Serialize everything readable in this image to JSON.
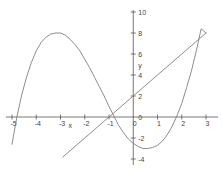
{
  "chart_data": {
    "type": "line",
    "title": "",
    "xlabel": "x",
    "ylabel": "y",
    "xlim": [
      -5,
      3
    ],
    "ylim": [
      -4,
      10
    ],
    "grid": false,
    "legend": "none",
    "xticks": [
      -5,
      -4,
      -3,
      -2,
      -1,
      0,
      1,
      2,
      3
    ],
    "xtick_labels": [
      "-5",
      "-4",
      "-3",
      "-2",
      "-1",
      "0",
      "1",
      "2",
      "3"
    ],
    "yticks": [
      -4,
      -2,
      0,
      2,
      4,
      6,
      8,
      10
    ],
    "ytick_labels": [
      "-4",
      "-2",
      "0",
      "2",
      "4",
      "6",
      "8",
      "10"
    ],
    "series": [
      {
        "name": "cubic-curve",
        "color": "#808080",
        "kind": "curve",
        "x": [
          -5.0,
          -4.8,
          -4.6,
          -4.4,
          -4.2,
          -4.0,
          -3.8,
          -3.6,
          -3.4,
          -3.2,
          -3.0,
          -2.8,
          -2.6,
          -2.4,
          -2.2,
          -2.0,
          -1.8,
          -1.6,
          -1.4,
          -1.2,
          -1.0,
          -0.8,
          -0.6,
          -0.4,
          -0.2,
          0.0,
          0.2,
          0.4,
          0.6,
          0.8,
          1.0,
          1.2,
          1.4,
          1.6,
          1.8,
          2.0,
          2.2,
          2.4,
          2.6,
          2.8,
          3.0
        ],
        "y": [
          -2.6,
          0.0,
          2.1,
          3.8,
          5.2,
          6.3,
          7.1,
          7.6,
          7.9,
          8.0,
          8.0,
          7.8,
          7.4,
          6.9,
          6.3,
          5.5,
          4.7,
          3.8,
          2.9,
          2.0,
          1.0,
          0.1,
          -0.8,
          -1.5,
          -2.1,
          -2.5,
          -2.8,
          -3.0,
          -3.0,
          -2.9,
          -2.7,
          -2.3,
          -1.7,
          -0.9,
          0.1,
          1.3,
          2.8,
          4.4,
          6.3,
          8.4,
          8.0
        ],
        "features": {
          "local_max": {
            "x": -3.0,
            "y": 8.0
          },
          "local_min": {
            "x": 1.0,
            "y": -2.7
          },
          "x_intercepts": [
            -4.8,
            -0.6,
            2.1
          ],
          "y_intercept": -2.5,
          "right_endpoint": {
            "x": 3.0,
            "y": 8.0
          }
        }
      },
      {
        "name": "straight-line",
        "color": "#808080",
        "kind": "line",
        "x": [
          -2.9,
          3.0
        ],
        "y": [
          -3.8,
          8.0
        ],
        "features": {
          "slope": 2.0,
          "y_intercept": 2.0,
          "x_intercept": -1.0
        }
      }
    ]
  },
  "axes": {
    "x_axis_label": "x",
    "y_axis_label": "y"
  }
}
